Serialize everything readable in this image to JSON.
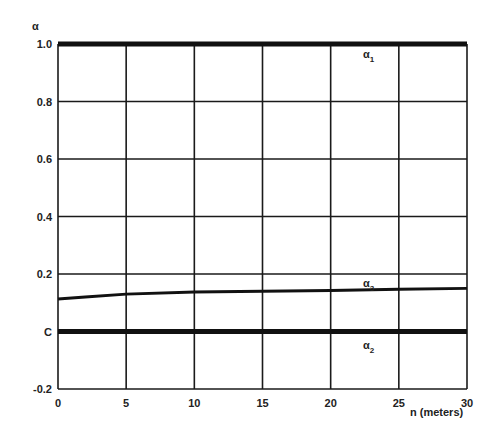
{
  "chart_data": {
    "type": "line",
    "title": "",
    "ylabel": "α",
    "xlabel": "n (meters)",
    "xlim": [
      0,
      30
    ],
    "ylim": [
      -0.2,
      1.0
    ],
    "grid": true,
    "x_ticks": [
      "0",
      "5",
      "10",
      "15",
      "20",
      "25",
      "30"
    ],
    "y_ticks": [
      "1.0",
      "0.8",
      "0.6",
      "0.4",
      "0.2",
      "0",
      "-0.2"
    ],
    "series": [
      {
        "name": "α1",
        "label": "α",
        "sub": "1",
        "x": [
          0,
          5,
          10,
          15,
          20,
          25,
          30
        ],
        "values": [
          1.0,
          1.0,
          1.0,
          1.0,
          1.0,
          1.0,
          1.0
        ],
        "style": "thick"
      },
      {
        "name": "α3",
        "label": "α",
        "sub": "3",
        "x": [
          0,
          2,
          5,
          10,
          15,
          20,
          25,
          30
        ],
        "values": [
          0.113,
          0.12,
          0.13,
          0.137,
          0.14,
          0.143,
          0.147,
          0.15
        ],
        "style": "medium"
      },
      {
        "name": "α2",
        "label": "α",
        "sub": "2",
        "x": [
          0,
          5,
          10,
          15,
          20,
          25,
          30
        ],
        "values": [
          0.0,
          0.0,
          0.0,
          0.0,
          0.0,
          0.0,
          0.0
        ],
        "style": "thick"
      }
    ],
    "legend_position": "inline labels near right of curves"
  }
}
